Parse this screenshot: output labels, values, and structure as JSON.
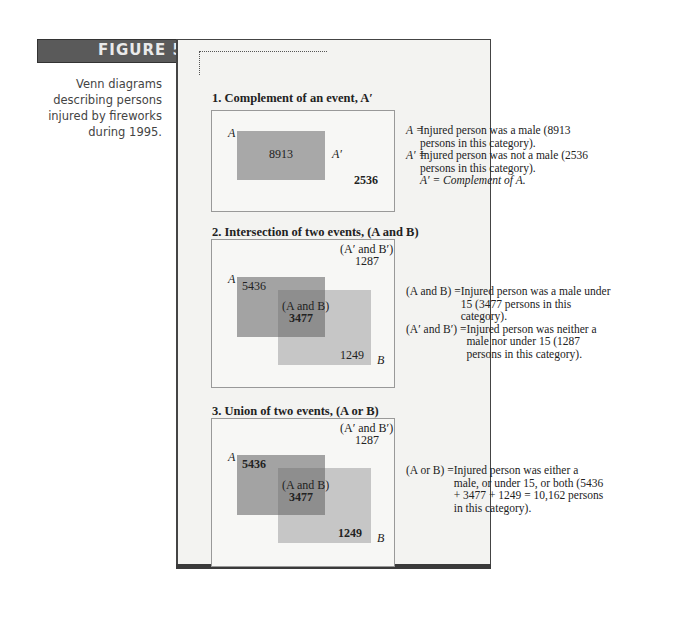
{
  "figure": {
    "label": "FIGURE 5.1",
    "caption": "Venn diagrams describing persons injured by fireworks during 1995."
  },
  "sections": [
    {
      "title": "1. Complement of an event, A′",
      "labels": {
        "A": "A",
        "A_prime": "A′",
        "inside_A": "8913",
        "outside": "2536"
      },
      "legend": [
        {
          "key": "A  =",
          "text": "Injured person was a male (8913 persons in this category)."
        },
        {
          "key": "A′ =",
          "text": "Injured person was not a male (2536 persons in this category)."
        },
        {
          "key": "",
          "text": "A′ = Complement of A."
        }
      ]
    },
    {
      "title": "2. Intersection of two events, (A and B)",
      "labels": {
        "A": "A",
        "B": "B",
        "A_only": "5436",
        "A_and_B_label": "(A and B)",
        "A_and_B": "3477",
        "B_only": "1249",
        "neither_label": "(A′ and B′)",
        "neither": "1287"
      },
      "legend": [
        {
          "key": "(A and B)  =",
          "text": "Injured person was a male under 15 (3477 persons in this category)."
        },
        {
          "key": "(A′ and B′) =",
          "text": "Injured person was neither a male nor under 15 (1287 persons in this category)."
        }
      ]
    },
    {
      "title": "3. Union of two events, (A or B)",
      "labels": {
        "A": "A",
        "B": "B",
        "A_only": "5436",
        "A_and_B_label": "(A and B)",
        "A_and_B": "3477",
        "B_only": "1249",
        "neither_label": "(A′ and B′)",
        "neither": "1287"
      },
      "legend": [
        {
          "key": "(A or B) =",
          "text": "Injured person was either a male, or under 15, or both (5436 + 3477 + 1249 = 10,162 persons in this category)."
        }
      ]
    }
  ],
  "colors": {
    "A_region": "#a3a3a3",
    "B_region": "#c4c4c4",
    "overlap": "#8e8e8e",
    "tab": "#5a5a5a",
    "panel": "#f3f3f1"
  }
}
